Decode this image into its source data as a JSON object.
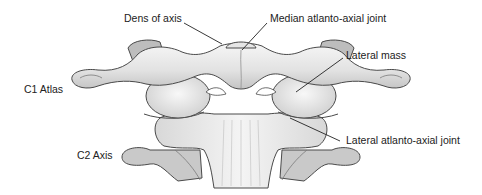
{
  "figure": {
    "colors": {
      "background": "#ffffff",
      "bone_light": "#f1f1f1",
      "bone_mid": "#d6d6d6",
      "bone_shadow": "#a9a9a9",
      "outline": "#4a4a4a",
      "label_text": "#222222",
      "leader_line": "#222222"
    },
    "labels": {
      "dens": "Dens of axis",
      "median_joint": "Median atlanto-axial joint",
      "lateral_mass": "Lateral mass",
      "c1": "C1 Atlas",
      "c2": "C2 Axis",
      "lateral_joint": "Lateral atlanto-axial joint"
    }
  }
}
